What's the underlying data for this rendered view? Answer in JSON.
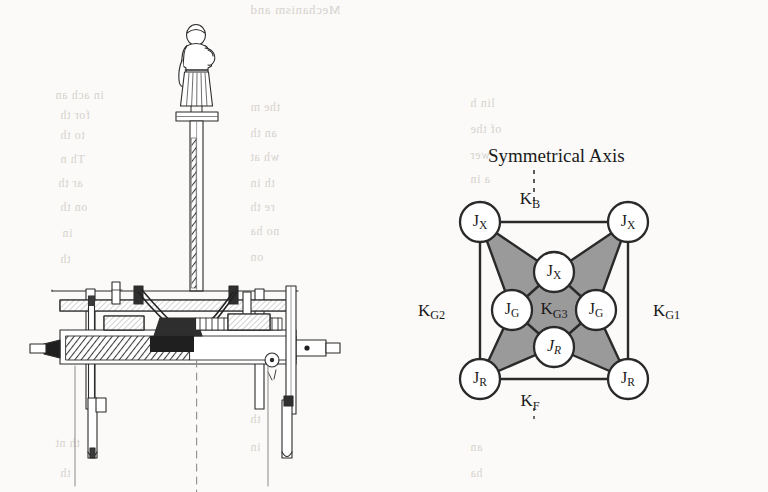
{
  "figure": {
    "caption_present": false,
    "background_color": "#fbfaf8",
    "ink_color": "#1a1a1a",
    "panels": [
      {
        "id": "mechanism",
        "type": "technical-cutaway-drawing",
        "description_icon": "south-pointing-chariot-mechanism"
      },
      {
        "id": "kinematic",
        "type": "node-link-diagram"
      }
    ]
  },
  "mechanism": {
    "figurine_icon": "robed-figure-statuette",
    "post_icon": "vertical-shaft",
    "gear_icon": "gear-train-assembly",
    "wheel_icon": "wheel-rim",
    "centerline_icon": "dashed-centerline"
  },
  "kinematic": {
    "title": "Symmetrical Axis",
    "axis_icon": "dashed-vertical-axis",
    "fill_color": "#9a9a9a",
    "node_fill": "#ffffff",
    "stroke_color": "#1a1a1a",
    "nodes": [
      {
        "id": "n-tl",
        "base": "J",
        "sub": "X",
        "italic": false,
        "x": 70,
        "y": 82,
        "r": 20,
        "role": "corner-top-left"
      },
      {
        "id": "n-tr",
        "base": "J",
        "sub": "X",
        "italic": false,
        "x": 218,
        "y": 82,
        "r": 20,
        "role": "corner-top-right"
      },
      {
        "id": "n-bl",
        "base": "J",
        "sub": "R",
        "italic": false,
        "x": 70,
        "y": 239,
        "r": 20,
        "role": "corner-bottom-left"
      },
      {
        "id": "n-br",
        "base": "J",
        "sub": "R",
        "italic": false,
        "x": 218,
        "y": 239,
        "r": 20,
        "role": "corner-bottom-right"
      },
      {
        "id": "n-top",
        "base": "J",
        "sub": "X",
        "italic": false,
        "x": 144,
        "y": 132,
        "r": 20,
        "role": "inner-top"
      },
      {
        "id": "n-left",
        "base": "J",
        "sub": "G",
        "italic": false,
        "x": 102,
        "y": 170,
        "r": 20,
        "role": "inner-left"
      },
      {
        "id": "n-right",
        "base": "J",
        "sub": "G",
        "italic": false,
        "x": 186,
        "y": 170,
        "r": 20,
        "role": "inner-right"
      },
      {
        "id": "n-bot",
        "base": "J",
        "sub": "R",
        "italic": true,
        "x": 144,
        "y": 207,
        "r": 20,
        "role": "inner-bottom"
      }
    ],
    "edge_labels": [
      {
        "id": "k-b",
        "base": "K",
        "sub": "B",
        "x": 120,
        "y": 60,
        "anchor": "center",
        "role": "top-link"
      },
      {
        "id": "k-f",
        "base": "K",
        "sub": "F",
        "x": 120,
        "y": 262,
        "anchor": "center",
        "role": "bottom-link"
      },
      {
        "id": "k-g2",
        "base": "K",
        "sub": "G2",
        "x": 8,
        "y": 162,
        "anchor": "left",
        "role": "left-link"
      },
      {
        "id": "k-g1",
        "base": "K",
        "sub": "G1",
        "x": 243,
        "y": 162,
        "anchor": "left",
        "role": "right-link"
      },
      {
        "id": "k-g3",
        "base": "K",
        "sub": "G3",
        "x": 144,
        "y": 170,
        "anchor": "center",
        "role": "center-link"
      }
    ]
  },
  "ghost_text": [
    {
      "t": "Mechanism and",
      "x": 250,
      "y": 2,
      "s": 13
    },
    {
      "t": "in ach an",
      "x": 55,
      "y": 88,
      "s": 12
    },
    {
      "t": "for th",
      "x": 60,
      "y": 108,
      "s": 12
    },
    {
      "t": "the m",
      "x": 250,
      "y": 100,
      "s": 12
    },
    {
      "t": "lin h",
      "x": 470,
      "y": 96,
      "s": 12
    },
    {
      "t": "to th",
      "x": 60,
      "y": 128,
      "s": 12
    },
    {
      "t": "an th",
      "x": 250,
      "y": 126,
      "s": 12
    },
    {
      "t": "of the",
      "x": 470,
      "y": 122,
      "s": 12
    },
    {
      "t": "Th n",
      "x": 60,
      "y": 152,
      "s": 12
    },
    {
      "t": "wh at",
      "x": 250,
      "y": 150,
      "s": 12
    },
    {
      "t": "wer",
      "x": 470,
      "y": 148,
      "s": 12
    },
    {
      "t": "ar th",
      "x": 58,
      "y": 176,
      "s": 12
    },
    {
      "t": "th in",
      "x": 250,
      "y": 176,
      "s": 12
    },
    {
      "t": "a in",
      "x": 470,
      "y": 172,
      "s": 12
    },
    {
      "t": "on th",
      "x": 60,
      "y": 200,
      "s": 12
    },
    {
      "t": "re th",
      "x": 250,
      "y": 200,
      "s": 12
    },
    {
      "t": "th a",
      "x": 470,
      "y": 198,
      "s": 12
    },
    {
      "t": "in",
      "x": 62,
      "y": 226,
      "s": 12
    },
    {
      "t": "no ha",
      "x": 250,
      "y": 224,
      "s": 12
    },
    {
      "t": "e th",
      "x": 470,
      "y": 224,
      "s": 12
    },
    {
      "t": "th",
      "x": 60,
      "y": 252,
      "s": 12
    },
    {
      "t": "on",
      "x": 250,
      "y": 250,
      "s": 12
    },
    {
      "t": "a th",
      "x": 60,
      "y": 300,
      "s": 12
    },
    {
      "t": "th",
      "x": 250,
      "y": 300,
      "s": 12
    },
    {
      "t": "in",
      "x": 60,
      "y": 330,
      "s": 12
    },
    {
      "t": "th",
      "x": 250,
      "y": 412,
      "s": 12
    },
    {
      "t": "th nt",
      "x": 55,
      "y": 436,
      "s": 12
    },
    {
      "t": "in",
      "x": 250,
      "y": 440,
      "s": 12
    },
    {
      "t": "an",
      "x": 470,
      "y": 440,
      "s": 12
    },
    {
      "t": "th",
      "x": 60,
      "y": 466,
      "s": 12
    },
    {
      "t": "ha",
      "x": 470,
      "y": 466,
      "s": 12
    }
  ]
}
